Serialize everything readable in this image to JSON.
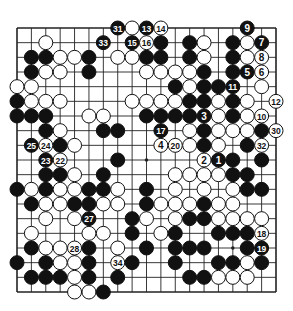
{
  "diagram": {
    "type": "go-board",
    "size": 19,
    "colors": {
      "background": "#ffffff",
      "line": "#222222",
      "black": "#111111",
      "white": "#ffffff"
    },
    "geometry": {
      "left": 17,
      "top": 28,
      "right": 276,
      "bottom": 292,
      "stone_radius": 7
    },
    "star_points": [
      [
        3,
        3
      ],
      [
        3,
        9
      ],
      [
        3,
        15
      ],
      [
        9,
        3
      ],
      [
        9,
        9
      ],
      [
        9,
        15
      ],
      [
        15,
        3
      ],
      [
        15,
        9
      ],
      [
        15,
        15
      ]
    ],
    "stones": [
      {
        "r": 0,
        "c": 8,
        "color": "W"
      },
      {
        "r": 1,
        "c": 2,
        "color": "W"
      },
      {
        "r": 1,
        "c": 10,
        "color": "B"
      },
      {
        "r": 1,
        "c": 12,
        "color": "B"
      },
      {
        "r": 1,
        "c": 13,
        "color": "W"
      },
      {
        "r": 1,
        "c": 15,
        "color": "B"
      },
      {
        "r": 1,
        "c": 16,
        "color": "W"
      },
      {
        "r": 2,
        "c": 1,
        "color": "B"
      },
      {
        "r": 2,
        "c": 2,
        "color": "B"
      },
      {
        "r": 2,
        "c": 3,
        "color": "W"
      },
      {
        "r": 2,
        "c": 4,
        "color": "W"
      },
      {
        "r": 2,
        "c": 5,
        "color": "B"
      },
      {
        "r": 2,
        "c": 7,
        "color": "W"
      },
      {
        "r": 2,
        "c": 8,
        "color": "W"
      },
      {
        "r": 2,
        "c": 9,
        "color": "B"
      },
      {
        "r": 2,
        "c": 10,
        "color": "B"
      },
      {
        "r": 2,
        "c": 12,
        "color": "B"
      },
      {
        "r": 2,
        "c": 13,
        "color": "W"
      },
      {
        "r": 2,
        "c": 15,
        "color": "B"
      },
      {
        "r": 2,
        "c": 16,
        "color": "W"
      },
      {
        "r": 3,
        "c": 1,
        "color": "B"
      },
      {
        "r": 3,
        "c": 2,
        "color": "W"
      },
      {
        "r": 3,
        "c": 3,
        "color": "W"
      },
      {
        "r": 3,
        "c": 5,
        "color": "B"
      },
      {
        "r": 3,
        "c": 9,
        "color": "W"
      },
      {
        "r": 3,
        "c": 10,
        "color": "W"
      },
      {
        "r": 3,
        "c": 11,
        "color": "W"
      },
      {
        "r": 3,
        "c": 12,
        "color": "W"
      },
      {
        "r": 3,
        "c": 13,
        "color": "B"
      },
      {
        "r": 3,
        "c": 15,
        "color": "B"
      },
      {
        "r": 4,
        "c": 0,
        "color": "W"
      },
      {
        "r": 4,
        "c": 1,
        "color": "W"
      },
      {
        "r": 4,
        "c": 11,
        "color": "B"
      },
      {
        "r": 4,
        "c": 12,
        "color": "W"
      },
      {
        "r": 4,
        "c": 13,
        "color": "B"
      },
      {
        "r": 4,
        "c": 14,
        "color": "B"
      },
      {
        "r": 4,
        "c": 17,
        "color": "W"
      },
      {
        "r": 5,
        "c": 0,
        "color": "B"
      },
      {
        "r": 5,
        "c": 1,
        "color": "W"
      },
      {
        "r": 5,
        "c": 2,
        "color": "W"
      },
      {
        "r": 5,
        "c": 3,
        "color": "W"
      },
      {
        "r": 5,
        "c": 8,
        "color": "W"
      },
      {
        "r": 5,
        "c": 9,
        "color": "W"
      },
      {
        "r": 5,
        "c": 10,
        "color": "W"
      },
      {
        "r": 5,
        "c": 11,
        "color": "W"
      },
      {
        "r": 5,
        "c": 12,
        "color": "B"
      },
      {
        "r": 5,
        "c": 13,
        "color": "B"
      },
      {
        "r": 5,
        "c": 14,
        "color": "W"
      },
      {
        "r": 5,
        "c": 15,
        "color": "B"
      },
      {
        "r": 5,
        "c": 16,
        "color": "W"
      },
      {
        "r": 6,
        "c": 0,
        "color": "B"
      },
      {
        "r": 6,
        "c": 1,
        "color": "B"
      },
      {
        "r": 6,
        "c": 2,
        "color": "B"
      },
      {
        "r": 6,
        "c": 5,
        "color": "W"
      },
      {
        "r": 6,
        "c": 6,
        "color": "W"
      },
      {
        "r": 6,
        "c": 9,
        "color": "B"
      },
      {
        "r": 6,
        "c": 10,
        "color": "B"
      },
      {
        "r": 6,
        "c": 11,
        "color": "B"
      },
      {
        "r": 6,
        "c": 12,
        "color": "B"
      },
      {
        "r": 6,
        "c": 14,
        "color": "W"
      },
      {
        "r": 6,
        "c": 15,
        "color": "B"
      },
      {
        "r": 6,
        "c": 16,
        "color": "W"
      },
      {
        "r": 7,
        "c": 2,
        "color": "B"
      },
      {
        "r": 7,
        "c": 3,
        "color": "W"
      },
      {
        "r": 7,
        "c": 6,
        "color": "B"
      },
      {
        "r": 7,
        "c": 7,
        "color": "B"
      },
      {
        "r": 7,
        "c": 12,
        "color": "W"
      },
      {
        "r": 7,
        "c": 13,
        "color": "B"
      },
      {
        "r": 7,
        "c": 14,
        "color": "W"
      },
      {
        "r": 7,
        "c": 15,
        "color": "W"
      },
      {
        "r": 7,
        "c": 16,
        "color": "W"
      },
      {
        "r": 7,
        "c": 17,
        "color": "B"
      },
      {
        "r": 8,
        "c": 3,
        "color": "B"
      },
      {
        "r": 8,
        "c": 4,
        "color": "W"
      },
      {
        "r": 8,
        "c": 12,
        "color": "W"
      },
      {
        "r": 8,
        "c": 13,
        "color": "B"
      },
      {
        "r": 8,
        "c": 14,
        "color": "W"
      },
      {
        "r": 8,
        "c": 16,
        "color": "B"
      },
      {
        "r": 9,
        "c": 7,
        "color": "B"
      },
      {
        "r": 9,
        "c": 15,
        "color": "B"
      },
      {
        "r": 9,
        "c": 17,
        "color": "B"
      },
      {
        "r": 10,
        "c": 2,
        "color": "B"
      },
      {
        "r": 10,
        "c": 3,
        "color": "B"
      },
      {
        "r": 10,
        "c": 4,
        "color": "W"
      },
      {
        "r": 10,
        "c": 6,
        "color": "B"
      },
      {
        "r": 10,
        "c": 11,
        "color": "W"
      },
      {
        "r": 10,
        "c": 12,
        "color": "W"
      },
      {
        "r": 10,
        "c": 13,
        "color": "W"
      },
      {
        "r": 10,
        "c": 14,
        "color": "W"
      },
      {
        "r": 10,
        "c": 15,
        "color": "B"
      },
      {
        "r": 10,
        "c": 16,
        "color": "B"
      },
      {
        "r": 11,
        "c": 0,
        "color": "B"
      },
      {
        "r": 11,
        "c": 1,
        "color": "W"
      },
      {
        "r": 11,
        "c": 2,
        "color": "B"
      },
      {
        "r": 11,
        "c": 3,
        "color": "W"
      },
      {
        "r": 11,
        "c": 4,
        "color": "W"
      },
      {
        "r": 11,
        "c": 5,
        "color": "B"
      },
      {
        "r": 11,
        "c": 6,
        "color": "B"
      },
      {
        "r": 11,
        "c": 7,
        "color": "W"
      },
      {
        "r": 11,
        "c": 9,
        "color": "B"
      },
      {
        "r": 11,
        "c": 11,
        "color": "W"
      },
      {
        "r": 11,
        "c": 13,
        "color": "W"
      },
      {
        "r": 11,
        "c": 15,
        "color": "W"
      },
      {
        "r": 11,
        "c": 16,
        "color": "B"
      },
      {
        "r": 11,
        "c": 17,
        "color": "B"
      },
      {
        "r": 12,
        "c": 1,
        "color": "B"
      },
      {
        "r": 12,
        "c": 2,
        "color": "W"
      },
      {
        "r": 12,
        "c": 3,
        "color": "W"
      },
      {
        "r": 12,
        "c": 4,
        "color": "B"
      },
      {
        "r": 12,
        "c": 5,
        "color": "B"
      },
      {
        "r": 12,
        "c": 6,
        "color": "W"
      },
      {
        "r": 12,
        "c": 7,
        "color": "W"
      },
      {
        "r": 12,
        "c": 9,
        "color": "B"
      },
      {
        "r": 12,
        "c": 10,
        "color": "W"
      },
      {
        "r": 12,
        "c": 11,
        "color": "W"
      },
      {
        "r": 12,
        "c": 12,
        "color": "W"
      },
      {
        "r": 12,
        "c": 13,
        "color": "B"
      },
      {
        "r": 12,
        "c": 14,
        "color": "W"
      },
      {
        "r": 12,
        "c": 15,
        "color": "W"
      },
      {
        "r": 13,
        "c": 2,
        "color": "W"
      },
      {
        "r": 13,
        "c": 4,
        "color": "W"
      },
      {
        "r": 13,
        "c": 8,
        "color": "B"
      },
      {
        "r": 13,
        "c": 9,
        "color": "W"
      },
      {
        "r": 13,
        "c": 11,
        "color": "W"
      },
      {
        "r": 13,
        "c": 12,
        "color": "B"
      },
      {
        "r": 13,
        "c": 13,
        "color": "B"
      },
      {
        "r": 13,
        "c": 14,
        "color": "W"
      },
      {
        "r": 13,
        "c": 15,
        "color": "W"
      },
      {
        "r": 13,
        "c": 16,
        "color": "W"
      },
      {
        "r": 13,
        "c": 17,
        "color": "W"
      },
      {
        "r": 14,
        "c": 1,
        "color": "W"
      },
      {
        "r": 14,
        "c": 5,
        "color": "W"
      },
      {
        "r": 14,
        "c": 6,
        "color": "W"
      },
      {
        "r": 14,
        "c": 8,
        "color": "B"
      },
      {
        "r": 14,
        "c": 10,
        "color": "W"
      },
      {
        "r": 14,
        "c": 11,
        "color": "B"
      },
      {
        "r": 14,
        "c": 14,
        "color": "B"
      },
      {
        "r": 14,
        "c": 15,
        "color": "B"
      },
      {
        "r": 14,
        "c": 16,
        "color": "B"
      },
      {
        "r": 15,
        "c": 1,
        "color": "B"
      },
      {
        "r": 15,
        "c": 2,
        "color": "W"
      },
      {
        "r": 15,
        "c": 3,
        "color": "W"
      },
      {
        "r": 15,
        "c": 5,
        "color": "B"
      },
      {
        "r": 15,
        "c": 7,
        "color": "W"
      },
      {
        "r": 15,
        "c": 9,
        "color": "B"
      },
      {
        "r": 15,
        "c": 11,
        "color": "B"
      },
      {
        "r": 15,
        "c": 12,
        "color": "B"
      },
      {
        "r": 15,
        "c": 13,
        "color": "B"
      },
      {
        "r": 15,
        "c": 16,
        "color": "B"
      },
      {
        "r": 16,
        "c": 0,
        "color": "B"
      },
      {
        "r": 16,
        "c": 2,
        "color": "B"
      },
      {
        "r": 16,
        "c": 3,
        "color": "W"
      },
      {
        "r": 16,
        "c": 4,
        "color": "W"
      },
      {
        "r": 16,
        "c": 5,
        "color": "B"
      },
      {
        "r": 16,
        "c": 8,
        "color": "B"
      },
      {
        "r": 16,
        "c": 11,
        "color": "B"
      },
      {
        "r": 16,
        "c": 14,
        "color": "B"
      },
      {
        "r": 16,
        "c": 15,
        "color": "B"
      },
      {
        "r": 16,
        "c": 16,
        "color": "W"
      },
      {
        "r": 16,
        "c": 17,
        "color": "B"
      },
      {
        "r": 17,
        "c": 1,
        "color": "B"
      },
      {
        "r": 17,
        "c": 2,
        "color": "B"
      },
      {
        "r": 17,
        "c": 3,
        "color": "B"
      },
      {
        "r": 17,
        "c": 4,
        "color": "W"
      },
      {
        "r": 17,
        "c": 5,
        "color": "B"
      },
      {
        "r": 17,
        "c": 7,
        "color": "B"
      },
      {
        "r": 17,
        "c": 12,
        "color": "B"
      },
      {
        "r": 17,
        "c": 13,
        "color": "B"
      },
      {
        "r": 17,
        "c": 14,
        "color": "W"
      },
      {
        "r": 17,
        "c": 15,
        "color": "W"
      },
      {
        "r": 17,
        "c": 16,
        "color": "W"
      },
      {
        "r": 18,
        "c": 4,
        "color": "W"
      },
      {
        "r": 18,
        "c": 5,
        "color": "W"
      },
      {
        "r": 18,
        "c": 6,
        "color": "B"
      }
    ],
    "numbered_moves": [
      {
        "n": "1",
        "r": 9,
        "c": 14,
        "color": "B"
      },
      {
        "n": "2",
        "r": 9,
        "c": 13,
        "color": "W"
      },
      {
        "n": "3",
        "r": 6,
        "c": 13,
        "color": "B"
      },
      {
        "n": "4",
        "r": 8,
        "c": 10,
        "color": "W"
      },
      {
        "n": "5",
        "r": 3,
        "c": 16,
        "color": "B"
      },
      {
        "n": "6",
        "r": 3,
        "c": 17,
        "color": "W"
      },
      {
        "n": "7",
        "r": 1,
        "c": 17,
        "color": "B"
      },
      {
        "n": "8",
        "r": 2,
        "c": 17,
        "color": "W"
      },
      {
        "n": "9",
        "r": 0,
        "c": 16,
        "color": "B"
      },
      {
        "n": "10",
        "r": 6,
        "c": 17,
        "color": "W"
      },
      {
        "n": "11",
        "r": 4,
        "c": 15,
        "color": "B"
      },
      {
        "n": "12",
        "r": 5,
        "c": 18,
        "color": "W"
      },
      {
        "n": "13",
        "r": 0,
        "c": 9,
        "color": "B"
      },
      {
        "n": "14",
        "r": 0,
        "c": 10,
        "color": "W"
      },
      {
        "n": "15",
        "r": 1,
        "c": 8,
        "color": "B"
      },
      {
        "n": "16",
        "r": 1,
        "c": 9,
        "color": "W"
      },
      {
        "n": "17",
        "r": 7,
        "c": 10,
        "color": "B"
      },
      {
        "n": "18",
        "r": 14,
        "c": 17,
        "color": "W"
      },
      {
        "n": "19",
        "r": 15,
        "c": 17,
        "color": "B"
      },
      {
        "n": "20",
        "r": 8,
        "c": 11,
        "color": "W"
      },
      {
        "n": "22",
        "r": 9,
        "c": 3,
        "color": "W"
      },
      {
        "n": "23",
        "r": 9,
        "c": 2,
        "color": "B"
      },
      {
        "n": "24",
        "r": 8,
        "c": 2,
        "color": "W"
      },
      {
        "n": "25",
        "r": 8,
        "c": 1,
        "color": "B"
      },
      {
        "n": "27",
        "r": 13,
        "c": 5,
        "color": "B"
      },
      {
        "n": "28",
        "r": 15,
        "c": 4,
        "color": "W"
      },
      {
        "n": "30",
        "r": 7,
        "c": 18,
        "color": "W"
      },
      {
        "n": "31",
        "r": 0,
        "c": 7,
        "color": "B"
      },
      {
        "n": "32",
        "r": 8,
        "c": 17,
        "color": "W"
      },
      {
        "n": "33",
        "r": 1,
        "c": 6,
        "color": "B"
      },
      {
        "n": "34",
        "r": 16,
        "c": 7,
        "color": "W"
      }
    ]
  }
}
